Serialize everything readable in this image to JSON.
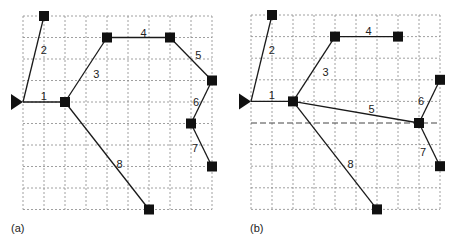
{
  "figure": {
    "grid": {
      "cols": 9,
      "rows": 9,
      "line_color": "#888888",
      "edge_color": "#1a1a1a",
      "node_color": "#111111"
    },
    "panels": [
      {
        "id": "a",
        "caption": "(a)",
        "source": {
          "col": 0,
          "row": 4
        },
        "emphasized_row": null,
        "nodes": [
          {
            "id": "n0",
            "col": 0,
            "row": 4,
            "type": "source"
          },
          {
            "id": "n1",
            "col": 1,
            "row": 0
          },
          {
            "id": "n2",
            "col": 2,
            "row": 4
          },
          {
            "id": "n3",
            "col": 4,
            "row": 1
          },
          {
            "id": "n4",
            "col": 7,
            "row": 1
          },
          {
            "id": "n5",
            "col": 9,
            "row": 3
          },
          {
            "id": "n6",
            "col": 8,
            "row": 5
          },
          {
            "id": "n7",
            "col": 9,
            "row": 7
          },
          {
            "id": "n8",
            "col": 6,
            "row": 9
          }
        ],
        "edges": [
          {
            "label": "1",
            "from": "n0",
            "to": "n2",
            "lx": 0.85,
            "ly": 3.7
          },
          {
            "label": "2",
            "from": "n0",
            "to": "n1",
            "lx": 0.85,
            "ly": 1.6
          },
          {
            "label": "3",
            "from": "n2",
            "to": "n3",
            "lx": 3.35,
            "ly": 2.7
          },
          {
            "label": "4",
            "from": "n3",
            "to": "n4",
            "lx": 5.6,
            "ly": 0.8
          },
          {
            "label": "5",
            "from": "n4",
            "to": "n5",
            "lx": 8.2,
            "ly": 1.8
          },
          {
            "label": "6",
            "from": "n5",
            "to": "n6",
            "lx": 8.1,
            "ly": 4.0
          },
          {
            "label": "7",
            "from": "n6",
            "to": "n7",
            "lx": 8.05,
            "ly": 6.15
          },
          {
            "label": "8",
            "from": "n2",
            "to": "n8",
            "lx": 4.45,
            "ly": 6.9
          }
        ]
      },
      {
        "id": "b",
        "caption": "(b)",
        "source": {
          "col": 0,
          "row": 4
        },
        "emphasized_row": 5,
        "nodes": [
          {
            "id": "n0",
            "col": 0,
            "row": 4,
            "type": "source"
          },
          {
            "id": "n1",
            "col": 1,
            "row": 0
          },
          {
            "id": "n2",
            "col": 2,
            "row": 4
          },
          {
            "id": "n3",
            "col": 4,
            "row": 1
          },
          {
            "id": "n4",
            "col": 7,
            "row": 1
          },
          {
            "id": "n5",
            "col": 9,
            "row": 3
          },
          {
            "id": "n6",
            "col": 8,
            "row": 5
          },
          {
            "id": "n7",
            "col": 9,
            "row": 7
          },
          {
            "id": "n8",
            "col": 6,
            "row": 9
          }
        ],
        "edges": [
          {
            "label": "1",
            "from": "n0",
            "to": "n2",
            "lx": 0.85,
            "ly": 3.7
          },
          {
            "label": "2",
            "from": "n0",
            "to": "n1",
            "lx": 0.85,
            "ly": 1.6
          },
          {
            "label": "3",
            "from": "n2",
            "to": "n3",
            "lx": 3.4,
            "ly": 2.65
          },
          {
            "label": "4",
            "from": "n3",
            "to": "n4",
            "lx": 5.45,
            "ly": 0.75
          },
          {
            "label": "5",
            "from": "n2",
            "to": "n6",
            "lx": 5.6,
            "ly": 4.35
          },
          {
            "label": "6",
            "from": "n6",
            "to": "n5",
            "lx": 7.95,
            "ly": 4.0
          },
          {
            "label": "7",
            "from": "n6",
            "to": "n7",
            "lx": 8.05,
            "ly": 6.35
          },
          {
            "label": "8",
            "from": "n2",
            "to": "n8",
            "lx": 4.6,
            "ly": 6.9
          }
        ]
      }
    ]
  }
}
